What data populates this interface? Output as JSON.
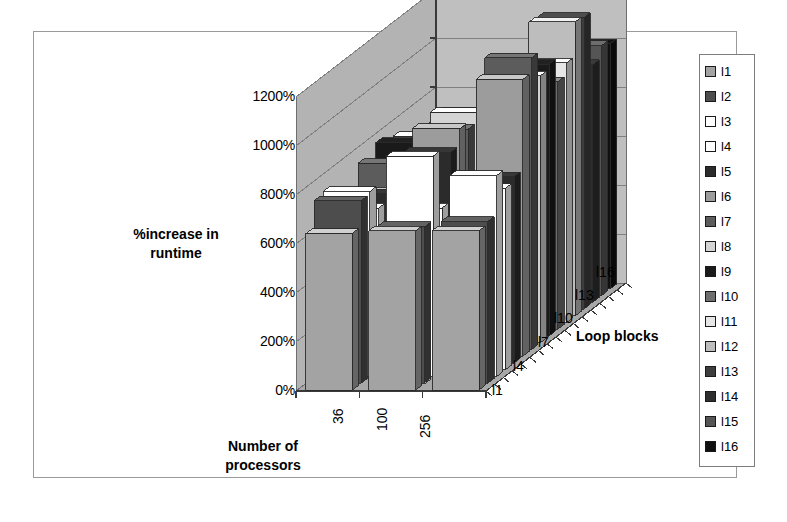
{
  "chart_data": {
    "type": "bar",
    "subtype": "3d-grouped-column",
    "title": "",
    "xlabel": "Number of processors",
    "ylabel": "%increase in runtime",
    "zlabel": "Loop blocks",
    "categories": [
      "36",
      "100",
      "256"
    ],
    "x_tick_labels": [
      "36",
      "100",
      "256"
    ],
    "z_tick_labels": [
      "l1",
      "l4",
      "l7",
      "l10",
      "l13",
      "l16"
    ],
    "y_tick_labels": [
      "0%",
      "200%",
      "400%",
      "600%",
      "800%",
      "1000%",
      "1200%"
    ],
    "y_ticks": [
      0,
      200,
      400,
      600,
      800,
      1000,
      1200
    ],
    "ylim": [
      0,
      1200
    ],
    "y_unit": "%",
    "grid": true,
    "legend_position": "right",
    "series": [
      {
        "name": "l1",
        "color": "#a3a3a3",
        "values": [
          640,
          650,
          650
        ]
      },
      {
        "name": "l2",
        "color": "#4d4d4d",
        "values": [
          745,
          640,
          660
        ]
      },
      {
        "name": "l3",
        "color": "#ffffff",
        "values": [
          755,
          900,
          820
        ]
      },
      {
        "name": "l4",
        "color": "#ffffff",
        "values": [
          660,
          660,
          740
        ]
      },
      {
        "name": "l5",
        "color": "#2b2b2b",
        "values": [
          690,
          860,
          760
        ]
      },
      {
        "name": "l6",
        "color": "#9c9c9c",
        "values": [
          670,
          930,
          1130
        ]
      },
      {
        "name": "l7",
        "color": "#5c5c5c",
        "values": [
          760,
          900,
          1190
        ]
      },
      {
        "name": "l8",
        "color": "#d4d4d4",
        "values": [
          700,
          940,
          1090
        ]
      },
      {
        "name": "l9",
        "color": "#1a1a1a",
        "values": [
          790,
          800,
          1110
        ]
      },
      {
        "name": "l10",
        "color": "#6e6e6e",
        "values": [
          745,
          620,
          1010
        ]
      },
      {
        "name": "l11",
        "color": "#e6e6e6",
        "values": [
          760,
          380,
          1060
        ]
      },
      {
        "name": "l12",
        "color": "#bdbdbd",
        "values": [
          700,
          600,
          1240
        ]
      },
      {
        "name": "l13",
        "color": "#3d3d3d",
        "values": [
          720,
          560,
          1190
        ]
      },
      {
        "name": "l14",
        "color": "#2e2e2e",
        "values": [
          690,
          540,
          970
        ]
      },
      {
        "name": "l15",
        "color": "#555555",
        "values": [
          700,
          620,
          1020
        ]
      },
      {
        "name": "l16",
        "color": "#101010",
        "values": [
          720,
          600,
          1000
        ]
      }
    ]
  },
  "axes": {
    "y_title": "%increase in\nruntime",
    "x_title": "Number of\nprocessors",
    "z_title": "Loop blocks"
  },
  "y_axis": {
    "labels": [
      "1200%",
      "1000%",
      "800%",
      "600%",
      "400%",
      "200%",
      "0%"
    ]
  },
  "x_axis": {
    "labels": [
      "36",
      "100",
      "256"
    ]
  },
  "z_axis": {
    "labels": [
      "l16",
      "l13",
      "l10",
      "l7",
      "l4",
      "l1"
    ]
  },
  "legend": {
    "items": [
      {
        "label": "l1",
        "color": "#a3a3a3"
      },
      {
        "label": "l2",
        "color": "#4d4d4d"
      },
      {
        "label": "l3",
        "color": "#ffffff"
      },
      {
        "label": "l4",
        "color": "#ffffff"
      },
      {
        "label": "l5",
        "color": "#2b2b2b"
      },
      {
        "label": "l6",
        "color": "#9c9c9c"
      },
      {
        "label": "l7",
        "color": "#5c5c5c"
      },
      {
        "label": "l8",
        "color": "#d4d4d4"
      },
      {
        "label": "l9",
        "color": "#1a1a1a"
      },
      {
        "label": "l10",
        "color": "#6e6e6e"
      },
      {
        "label": "l11",
        "color": "#e6e6e6"
      },
      {
        "label": "l12",
        "color": "#bdbdbd"
      },
      {
        "label": "l13",
        "color": "#3d3d3d"
      },
      {
        "label": "l14",
        "color": "#2e2e2e"
      },
      {
        "label": "l15",
        "color": "#555555"
      },
      {
        "label": "l16",
        "color": "#101010"
      }
    ]
  },
  "style": {
    "wall_color": "#bfbfbf",
    "wall_side_color": "#b3b3b3",
    "floor_color": "#a8a8a8",
    "grid_line_color": "#808080",
    "frame_color": "#9a9a9a",
    "text_color": "#000000"
  }
}
